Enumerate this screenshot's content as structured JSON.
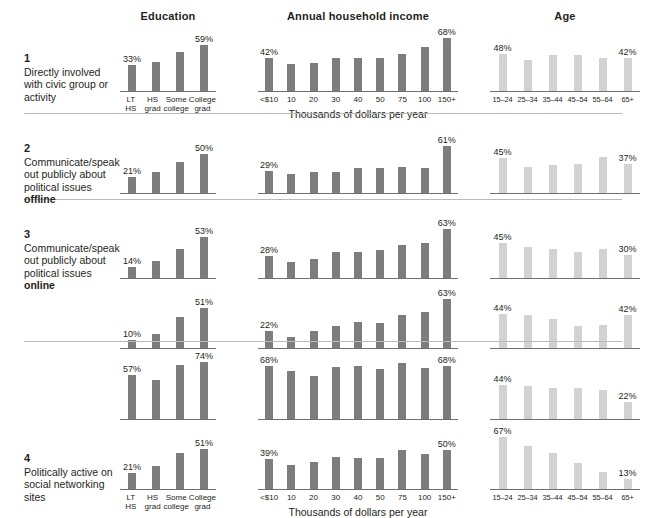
{
  "groups": {
    "education": {
      "title": "Education",
      "ticks": [
        "LT HS",
        "HS\ngrad",
        "Some\ncollege",
        "College\ngrad"
      ]
    },
    "income": {
      "title": "Annual household income",
      "ticks": [
        "<$10",
        "10",
        "20",
        "30",
        "40",
        "50",
        "75",
        "100",
        "150+"
      ],
      "axis_title": "Thousands of dollars per year"
    },
    "age": {
      "title": "Age",
      "ticks": [
        "15–24",
        "25–34",
        "35–44",
        "45–54",
        "55–64",
        "65+"
      ]
    }
  },
  "colors": {
    "bar_dark": "#7d7d7d",
    "bar_light": "#d2d2d2",
    "rule": "#b9b9b9",
    "axis": "#6f6f6f",
    "text": "#231f20"
  },
  "rows": [
    {
      "number": "1",
      "label_html": "Directly involved with civic group or activity",
      "label_plain": "Directly involved with civic group or activity",
      "education": {
        "values": [
          33,
          38,
          50,
          59
        ],
        "labels": [
          "33%",
          "",
          "",
          "59%"
        ]
      },
      "income": {
        "values": [
          42,
          35,
          36,
          42,
          43,
          43,
          48,
          57,
          68
        ],
        "labels": [
          "42%",
          "",
          "",
          "",
          "",
          "",
          "",
          "",
          "68%"
        ]
      },
      "age": {
        "values": [
          48,
          40,
          46,
          47,
          43,
          42
        ],
        "labels": [
          "48%",
          "",
          "",
          "",
          "",
          "42%"
        ]
      }
    },
    {
      "number": "2",
      "label_html": "Communicate/speak out publicly about political issues <b>offline</b>",
      "label_plain": "Communicate/speak out publicly about political issues offline",
      "education": {
        "values": [
          21,
          27,
          40,
          50
        ],
        "labels": [
          "21%",
          "",
          "",
          "50%"
        ]
      },
      "income": {
        "values": [
          29,
          24,
          27,
          27,
          32,
          32,
          34,
          32,
          61
        ],
        "labels": [
          "29%",
          "",
          "",
          "",
          "",
          "",
          "",
          "",
          "61%"
        ]
      },
      "age": {
        "values": [
          45,
          33,
          36,
          37,
          46,
          37
        ],
        "labels": [
          "45%",
          "",
          "",
          "",
          "",
          "37%"
        ]
      }
    },
    {
      "number": "3",
      "label_html": "Communicate/speak out publicly about political issues <b>online</b>",
      "label_plain": "Communicate/speak out publicly about political issues online",
      "education": {
        "values": [
          14,
          22,
          38,
          53
        ],
        "labels": [
          "14%",
          "",
          "",
          "53%"
        ]
      },
      "income": {
        "values": [
          28,
          20,
          24,
          33,
          34,
          36,
          43,
          45,
          63
        ],
        "labels": [
          "28%",
          "",
          "",
          "",
          "",
          "",
          "",
          "",
          "63%"
        ]
      },
      "age": {
        "values": [
          45,
          40,
          37,
          33,
          38,
          30
        ],
        "labels": [
          "45%",
          "",
          "",
          "",
          "",
          "30%"
        ]
      }
    },
    {
      "number": "",
      "label_html": "",
      "label_plain": "",
      "education": {
        "values": [
          10,
          18,
          40,
          51
        ],
        "labels": [
          "10%",
          "",
          "",
          "51%"
        ]
      },
      "income": {
        "values": [
          22,
          14,
          22,
          29,
          33,
          32,
          42,
          47,
          63
        ],
        "labels": [
          "22%",
          "",
          "",
          "",
          "",
          "",
          "",
          "",
          "63%"
        ]
      },
      "age": {
        "values": [
          44,
          42,
          37,
          28,
          30,
          42
        ],
        "labels": [
          "44%",
          "",
          "",
          "",
          "",
          "42%"
        ]
      }
    },
    {
      "number": "",
      "label_html": "",
      "label_plain": "",
      "education": {
        "values": [
          57,
          50,
          70,
          74
        ],
        "labels": [
          "57%",
          "",
          "",
          "74%"
        ]
      },
      "income": {
        "values": [
          68,
          62,
          56,
          67,
          68,
          64,
          72,
          66,
          68
        ],
        "labels": [
          "68%",
          "",
          "",
          "",
          "",
          "",
          "",
          "",
          "68%"
        ]
      },
      "age": {
        "values": [
          44,
          42,
          40,
          40,
          38,
          22
        ],
        "labels": [
          "44%",
          "",
          "",
          "",
          "",
          "22%"
        ]
      }
    },
    {
      "number": "4",
      "label_html": "Politically active on social networking sites",
      "label_plain": "Politically active on social networking sites",
      "education": {
        "values": [
          21,
          30,
          47,
          51
        ],
        "labels": [
          "21%",
          "",
          "",
          "51%"
        ]
      },
      "income": {
        "values": [
          39,
          31,
          35,
          41,
          40,
          40,
          50,
          45,
          50
        ],
        "labels": [
          "39%",
          "",
          "",
          "",
          "",
          "",
          "",
          "",
          "50%"
        ]
      },
      "age": {
        "values": [
          67,
          55,
          47,
          33,
          22,
          13
        ],
        "labels": [
          "67%",
          "",
          "",
          "",
          "",
          "13%"
        ]
      }
    }
  ],
  "chart_data": {
    "type": "bar",
    "title": "",
    "ylabel": "Percent",
    "ylim": [
      0,
      80
    ],
    "grid": false,
    "legend": "none",
    "panels": [
      "Education",
      "Annual household income",
      "Age"
    ],
    "panel_categories": {
      "Education": [
        "LT HS",
        "HS grad",
        "Some college",
        "College grad"
      ],
      "Annual household income": [
        "<$10",
        "10",
        "20",
        "30",
        "40",
        "50",
        "75",
        "100",
        "150+"
      ],
      "Age": [
        "15–24",
        "25–34",
        "35–44",
        "45–54",
        "55–64",
        "65+"
      ]
    },
    "xlabel": "Thousands of dollars per year",
    "series": [
      {
        "name": "1. Directly involved with civic group or activity",
        "Education": [
          33,
          38,
          50,
          59
        ],
        "Annual household income": [
          42,
          35,
          36,
          42,
          43,
          43,
          48,
          57,
          68
        ],
        "Age": [
          48,
          40,
          46,
          47,
          43,
          42
        ]
      },
      {
        "name": "2. Communicate/speak out publicly about political issues offline",
        "Education": [
          21,
          27,
          40,
          50
        ],
        "Annual household income": [
          29,
          24,
          27,
          27,
          32,
          32,
          34,
          32,
          61
        ],
        "Age": [
          45,
          33,
          36,
          37,
          46,
          37
        ]
      },
      {
        "name": "3. Communicate/speak out publicly about political issues online (a)",
        "Education": [
          14,
          22,
          38,
          53
        ],
        "Annual household income": [
          28,
          20,
          24,
          33,
          34,
          36,
          43,
          45,
          63
        ],
        "Age": [
          45,
          40,
          37,
          33,
          38,
          30
        ]
      },
      {
        "name": "3. Communicate/speak out publicly about political issues online (b)",
        "Education": [
          10,
          18,
          40,
          51
        ],
        "Annual household income": [
          22,
          14,
          22,
          29,
          33,
          32,
          42,
          47,
          63
        ],
        "Age": [
          44,
          42,
          37,
          28,
          30,
          42
        ]
      },
      {
        "name": "4. Politically active on social networking sites (a)",
        "Education": [
          57,
          50,
          70,
          74
        ],
        "Annual household income": [
          68,
          62,
          56,
          67,
          68,
          64,
          72,
          66,
          68
        ],
        "Age": [
          44,
          42,
          40,
          40,
          38,
          22
        ]
      },
      {
        "name": "4. Politically active on social networking sites (b)",
        "Education": [
          21,
          30,
          47,
          51
        ],
        "Annual household income": [
          39,
          31,
          35,
          41,
          40,
          40,
          50,
          45,
          50
        ],
        "Age": [
          67,
          55,
          47,
          33,
          22,
          13
        ]
      }
    ]
  }
}
